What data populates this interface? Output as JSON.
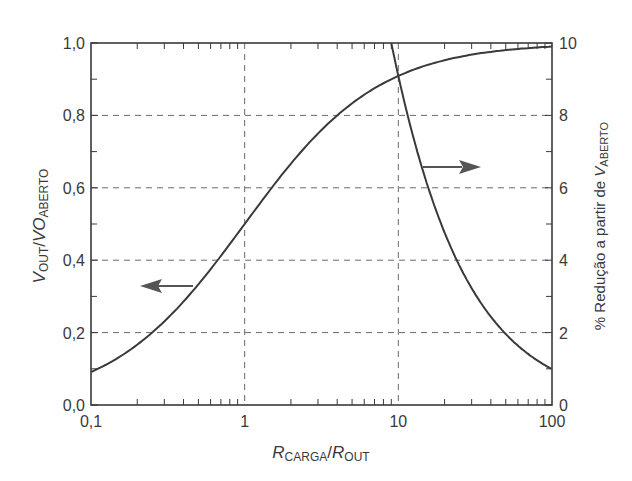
{
  "chart_data": {
    "type": "line",
    "title": "",
    "xlabel": {
      "main": "R",
      "main_sub": "CARGA",
      "sep": "/",
      "den": "R",
      "den_sub": "OUT"
    },
    "ylabel_left": {
      "main": "V",
      "main_sub": "OUT",
      "sep": "/",
      "den": "VO",
      "den_sub": "ABERTO"
    },
    "ylabel_right": {
      "prefix": "% Redução a partir de ",
      "main": "V",
      "main_sub": "ABERTO"
    },
    "x_scale": "log",
    "xlim": [
      0.1,
      100
    ],
    "ylim_left": [
      0.0,
      1.0
    ],
    "ylim_right": [
      0,
      10
    ],
    "x_ticks": [
      {
        "value": 0.1,
        "label": "0,1"
      },
      {
        "value": 1,
        "label": "1"
      },
      {
        "value": 10,
        "label": "10"
      },
      {
        "value": 100,
        "label": "100"
      }
    ],
    "y_left_ticks": [
      {
        "value": 0.0,
        "label": "0,0"
      },
      {
        "value": 0.2,
        "label": "0,2"
      },
      {
        "value": 0.4,
        "label": "0,4"
      },
      {
        "value": 0.6,
        "label": "0,6"
      },
      {
        "value": 0.8,
        "label": "0,8"
      },
      {
        "value": 1.0,
        "label": "1,0"
      }
    ],
    "y_right_ticks": [
      {
        "value": 0,
        "label": "0"
      },
      {
        "value": 2,
        "label": "2"
      },
      {
        "value": 4,
        "label": "4"
      },
      {
        "value": 6,
        "label": "6"
      },
      {
        "value": 8,
        "label": "8"
      },
      {
        "value": 10,
        "label": "10"
      }
    ],
    "grid": {
      "style": "dashed",
      "x": [
        1,
        10
      ],
      "y_left": [
        0.2,
        0.4,
        0.6,
        0.8
      ]
    },
    "series": [
      {
        "name": "VOUT/VOABERTO",
        "axis": "left",
        "formula": "R/(1+R)",
        "x": [
          0.1,
          0.2,
          0.3,
          0.5,
          0.7,
          1,
          1.5,
          2,
          3,
          5,
          7,
          10,
          20,
          30,
          50,
          70,
          100
        ],
        "values": [
          0.091,
          0.167,
          0.231,
          0.333,
          0.412,
          0.5,
          0.6,
          0.667,
          0.75,
          0.833,
          0.875,
          0.909,
          0.952,
          0.968,
          0.98,
          0.986,
          0.99
        ]
      },
      {
        "name": "% Redução a partir de VABERTO",
        "axis": "right",
        "formula": "100/(1+R)",
        "x": [
          9,
          10,
          12,
          15,
          20,
          25,
          30,
          40,
          50,
          70,
          100
        ],
        "values": [
          10.0,
          9.09,
          7.69,
          6.25,
          4.76,
          3.85,
          3.23,
          2.44,
          1.96,
          1.41,
          0.99
        ]
      }
    ],
    "annotations": [
      {
        "type": "arrow",
        "direction": "left",
        "points_to_axis": "left",
        "near_series": "VOUT/VOABERTO"
      },
      {
        "type": "arrow",
        "direction": "right",
        "points_to_axis": "right",
        "near_series": "% Redução a partir de VABERTO"
      }
    ],
    "legend": null
  },
  "colors": {
    "axis": "#3a3a3a",
    "curve": "#3a3a3a",
    "grid": "#6a6a6a",
    "arrow": "#555555",
    "background": "#ffffff"
  }
}
